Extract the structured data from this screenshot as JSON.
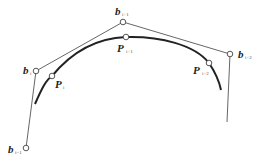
{
  "diagram": {
    "type": "b-spline-control-polygon",
    "colors": {
      "polygon": "#555555",
      "curve": "#222222",
      "point_fill": "#ffffff",
      "point_stroke": "#444444"
    },
    "control_points": [
      {
        "id": "b_i-1",
        "base": "b",
        "sub": "i−1",
        "x": 26,
        "y": 148
      },
      {
        "id": "b_i",
        "base": "b",
        "sub": "i",
        "x": 36,
        "y": 71
      },
      {
        "id": "b_i+1",
        "base": "b",
        "sub": "i+1",
        "x": 123,
        "y": 22
      },
      {
        "id": "b_i+2",
        "base": "b",
        "sub": "i+2",
        "x": 230,
        "y": 54
      }
    ],
    "curve_points": [
      {
        "id": "P_i",
        "base": "P",
        "sub": "i",
        "x": 52,
        "y": 76
      },
      {
        "id": "P_i+1",
        "base": "P",
        "sub": "i+1",
        "x": 126,
        "y": 37
      },
      {
        "id": "P_i+2",
        "base": "P",
        "sub": "i+2",
        "x": 209,
        "y": 63
      }
    ],
    "labels": {
      "b_im1": {
        "base": "b",
        "sub": "i−1"
      },
      "b_i": {
        "base": "b",
        "sub": "i"
      },
      "b_ip1": {
        "base": "b",
        "sub": "i+1"
      },
      "b_ip2": {
        "base": "b",
        "sub": "i+2"
      },
      "P_i": {
        "base": "P",
        "sub": "i"
      },
      "P_ip1": {
        "base": "P",
        "sub": "i+1"
      },
      "P_ip2": {
        "base": "P",
        "sub": "i+2"
      }
    }
  }
}
